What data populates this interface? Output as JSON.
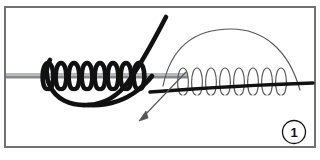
{
  "figure": {
    "step_badge": {
      "label": "1",
      "name": "step-number-1"
    },
    "frame": {
      "border_color": "#6f7173",
      "background_color": "#ffffff"
    },
    "colors": {
      "cord_dark": "#111111",
      "rod_grey": "#87898c",
      "rod_grey_light": "#b9babd",
      "thin_line": "#55565a",
      "badge_circle": "#111111",
      "page_background": "#ffffff"
    },
    "elements": [
      {
        "name": "horizontal-rod",
        "type": "rod",
        "description": "Grey horizontal rod spanning from left frame edge to mid-right",
        "x_start": 6,
        "x_end": 188,
        "y": 76,
        "thickness": 5
      },
      {
        "name": "thick-coil-left",
        "type": "coil",
        "description": "Thick black cord wrapped in tight turns around the rod",
        "turns": 8,
        "x_start": 45,
        "x_end": 147,
        "amplitude": 13,
        "stroke_width": 4.6
      },
      {
        "name": "thin-coil-right",
        "type": "coil",
        "description": "Thin outlined loose coil loops on the right side",
        "turns": 8,
        "x_start": 182,
        "x_end": 288,
        "amplitude": 13,
        "stroke_width": 1.2
      },
      {
        "name": "working-end-thick-line",
        "type": "line",
        "description": "Thick black working cord running through the right coil to the right edge",
        "x_start": 150,
        "x_end": 313,
        "y_start": 92,
        "y_end": 84
      },
      {
        "name": "standing-part-curve",
        "type": "curve",
        "description": "Thick cord descending from top and sweeping into a large bottom loop",
        "stroke_width": 4.6
      },
      {
        "name": "bottom-loop",
        "type": "curve",
        "description": "Large U-shaped thick loop under the rod from left tail to right",
        "stroke_width": 4.6
      },
      {
        "name": "thin-overhead-arc",
        "type": "arc",
        "description": "Thin arc arching above the right coil showing the cord path",
        "apex_x": 231,
        "apex_y": 29,
        "stroke_width": 1.2
      },
      {
        "name": "direction-arrow",
        "type": "arrow",
        "description": "Thin arrow pointing down and to the left indicating pull direction",
        "tip_x": 140,
        "tip_y": 120,
        "tail_x": 186,
        "tail_y": 72
      }
    ]
  }
}
